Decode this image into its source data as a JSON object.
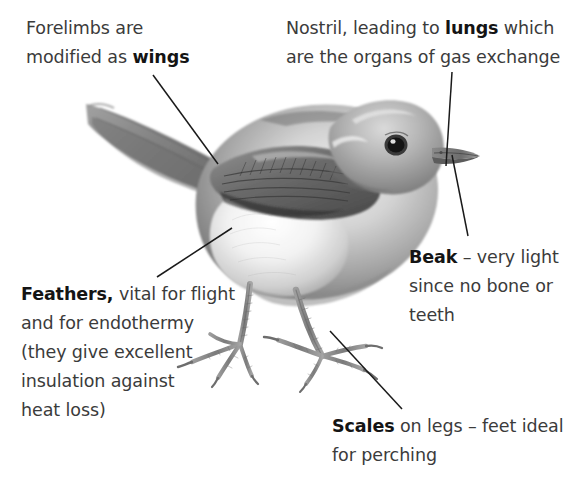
{
  "figure": {
    "background_color": "#ffffff",
    "text_color": "#3b3b3b",
    "bold_color": "#141414",
    "leader_line_color": "#1a1a1a"
  },
  "labels": {
    "forelimbs": {
      "name": "forelimbs-wings-label",
      "plain_1": "Forelimbs are",
      "plain_2": "modified as ",
      "bold_1": "wings",
      "full_text": "Forelimbs are modified as wings"
    },
    "nostril": {
      "name": "nostril-lungs-label",
      "plain_1": "Nostril, leading to ",
      "bold_1": "lungs",
      "plain_2": " which",
      "plain_3": "are the organs of gas exchange",
      "full_text": "Nostril, leading to lungs which are the organs of gas exchange"
    },
    "beak": {
      "name": "beak-label",
      "bold_1": "Beak",
      "plain_1": " – very light",
      "plain_2": "since no bone or",
      "plain_3": "teeth",
      "full_text": "Beak – very light since no bone or teeth"
    },
    "feathers": {
      "name": "feathers-label",
      "bold_1": "Feathers,",
      "plain_1": " vital for flight",
      "plain_2": "and for endothermy",
      "plain_3": "(they give excellent",
      "plain_4": "insulation against",
      "plain_5": "heat loss)",
      "full_text": "Feathers, vital for flight and for endothermy (they give excellent insulation against heat loss)"
    },
    "scales": {
      "name": "scales-label",
      "bold_1": "Scales",
      "plain_1": " on legs – feet ideal",
      "plain_2": "for perching",
      "full_text": "Scales on legs – feet ideal for perching"
    }
  },
  "leader_lines": [
    {
      "name": "leader-line-wings",
      "from_label": "forelimbs",
      "x1": 153,
      "y1": 75,
      "x2": 218,
      "y2": 164
    },
    {
      "name": "leader-line-nostril",
      "from_label": "nostril",
      "x1": 452,
      "y1": 72,
      "x2": 446,
      "y2": 166
    },
    {
      "name": "leader-line-beak",
      "from_label": "beak",
      "x1": 452,
      "y1": 155,
      "x2": 468,
      "y2": 236
    },
    {
      "name": "leader-line-feathers",
      "from_label": "feathers",
      "x1": 157,
      "y1": 277,
      "x2": 232,
      "y2": 228
    },
    {
      "name": "leader-line-scales",
      "from_label": "scales",
      "x1": 330,
      "y1": 331,
      "x2": 402,
      "y2": 409
    }
  ],
  "illustration": {
    "name": "bird-illustration",
    "parts": [
      "tail",
      "wing",
      "body",
      "breast",
      "head",
      "eye",
      "beak",
      "left-leg",
      "right-leg",
      "left-foot",
      "right-foot"
    ],
    "style": "grayscale pencil drawing"
  }
}
